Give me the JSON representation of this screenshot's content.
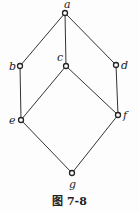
{
  "diagram": {
    "type": "hasse-diagram",
    "caption": "图 7-8",
    "nodes": [
      {
        "id": "a",
        "label": "a",
        "x": 65,
        "y": 13,
        "lx": 64,
        "ly": 8
      },
      {
        "id": "b",
        "label": "b",
        "x": 20,
        "y": 66,
        "lx": 9,
        "ly": 70
      },
      {
        "id": "c",
        "label": "c",
        "x": 66,
        "y": 66,
        "lx": 57,
        "ly": 61
      },
      {
        "id": "d",
        "label": "d",
        "x": 116,
        "y": 65,
        "lx": 121,
        "ly": 69
      },
      {
        "id": "e",
        "label": "e",
        "x": 21,
        "y": 120,
        "lx": 9,
        "ly": 124
      },
      {
        "id": "f",
        "label": "f",
        "x": 118,
        "y": 115,
        "lx": 123,
        "ly": 119
      },
      {
        "id": "g",
        "label": "g",
        "x": 72,
        "y": 173,
        "lx": 69,
        "ly": 188
      }
    ],
    "edges": [
      [
        "a",
        "b"
      ],
      [
        "a",
        "c"
      ],
      [
        "a",
        "d"
      ],
      [
        "b",
        "e"
      ],
      [
        "c",
        "e"
      ],
      [
        "c",
        "f"
      ],
      [
        "d",
        "f"
      ],
      [
        "e",
        "g"
      ],
      [
        "f",
        "g"
      ]
    ]
  }
}
